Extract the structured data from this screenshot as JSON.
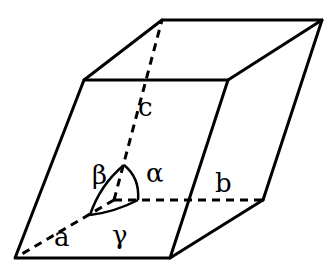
{
  "diagram": {
    "colors": {
      "line": "#000000",
      "background": "#ffffff"
    },
    "axes": [
      {
        "name": "a",
        "label": "a"
      },
      {
        "name": "b",
        "label": "b"
      },
      {
        "name": "c",
        "label": "c"
      }
    ],
    "angles": [
      {
        "name": "alpha",
        "label": "α"
      },
      {
        "name": "beta",
        "label": "β"
      },
      {
        "name": "gamma",
        "label": "γ"
      }
    ]
  }
}
